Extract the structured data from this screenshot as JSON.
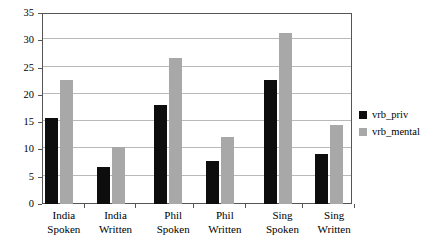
{
  "chart_data": {
    "type": "bar",
    "title": "",
    "xlabel": "",
    "ylabel": "",
    "ylim": [
      0,
      35
    ],
    "yticks": [
      0,
      5,
      10,
      15,
      20,
      25,
      30,
      35
    ],
    "grid": true,
    "legend_position": "right",
    "categories": [
      "India Spoken",
      "India Written",
      "Phil Spoken",
      "Phil Written",
      "Sing Spoken",
      "Sing Written"
    ],
    "category_lines": [
      [
        "India",
        "Spoken"
      ],
      [
        "India",
        "Written"
      ],
      [
        "Phil",
        "Spoken"
      ],
      [
        "Phil",
        "Written"
      ],
      [
        "Sing",
        "Spoken"
      ],
      [
        "Sing",
        "Written"
      ]
    ],
    "series": [
      {
        "name": "vrb_priv",
        "color": "#0d0d0d",
        "values": [
          15.7,
          6.8,
          18.1,
          7.8,
          22.8,
          9.1
        ]
      },
      {
        "name": "vrb_mental",
        "color": "#a8a8a8",
        "values": [
          22.7,
          10.4,
          26.8,
          12.3,
          31.3,
          14.5
        ]
      }
    ]
  },
  "legend": {
    "items": [
      {
        "label": "vrb_priv",
        "color": "#0d0d0d"
      },
      {
        "label": "vrb_mental",
        "color": "#a8a8a8"
      }
    ]
  },
  "axis": {
    "tick_labels": [
      "0",
      "5",
      "10",
      "15",
      "20",
      "25",
      "30",
      "35"
    ]
  },
  "colors": {
    "series_priv": "#0d0d0d",
    "series_mental": "#a8a8a8",
    "gridline": "#b9b9b9",
    "axis": "#555555",
    "background": "#ffffff"
  }
}
